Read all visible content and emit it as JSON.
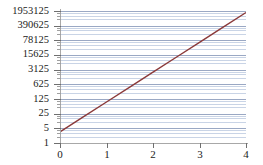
{
  "chart_data": {
    "type": "line",
    "title": "",
    "xlabel": "",
    "ylabel": "",
    "yscale": "log",
    "log_base": 5,
    "grid": true,
    "legend": "none",
    "xlim": [
      0,
      4
    ],
    "ylim": [
      1,
      1953125
    ],
    "x_ticks": [
      "0",
      "1",
      "2",
      "3",
      "4"
    ],
    "x_tick_values": [
      0,
      1,
      2,
      3,
      4
    ],
    "y_ticks": [
      "1953125",
      "390625",
      "78125",
      "15625",
      "3125",
      "625",
      "125",
      "25",
      "5",
      "1"
    ],
    "y_tick_values": [
      1953125,
      390625,
      78125,
      15625,
      3125,
      625,
      125,
      25,
      5,
      1
    ],
    "series": [
      {
        "name": "exponential",
        "color": "#8b3a3a",
        "x": [
          0,
          0.5,
          1,
          1.5,
          2,
          2.5,
          3,
          3.5,
          4
        ],
        "values": [
          3.4,
          17.5,
          90,
          460,
          2370,
          12200,
          62700,
          322000,
          1660000
        ]
      }
    ],
    "colors": {
      "line": "#8b3a3a",
      "grid_major": "#9aa8c4",
      "grid_minor": "#c9d4e6",
      "axis": "#a8a8a8",
      "tick_label": "#222222",
      "background": "#ffffff"
    }
  }
}
